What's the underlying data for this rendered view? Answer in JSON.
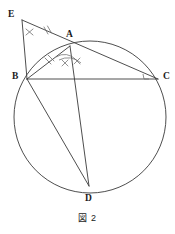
{
  "figure": {
    "caption": "図 2",
    "caption_position": {
      "y": 211
    },
    "stroke_color": "#3a3a3a",
    "mark_color": "#6f6f6f",
    "label_color": "#1a1a1a",
    "background": "#ffffff",
    "circle": {
      "name": "circumscribed-circle",
      "cx": 90,
      "cy": 117,
      "r": 76
    },
    "points": [
      {
        "id": "E",
        "label": "E",
        "x": 22,
        "y": 20,
        "label_x": 8,
        "label_y": 10
      },
      {
        "id": "A",
        "label": "A",
        "x": 70,
        "y": 46,
        "label_x": 66,
        "label_y": 30
      },
      {
        "id": "B",
        "label": "B",
        "x": 27,
        "y": 79,
        "label_x": 12,
        "label_y": 72
      },
      {
        "id": "C",
        "label": "C",
        "x": 158,
        "y": 79,
        "label_x": 163,
        "label_y": 72
      },
      {
        "id": "D",
        "label": "D",
        "x": 89,
        "y": 186,
        "label_x": 85,
        "label_y": 194
      }
    ],
    "segments": [
      {
        "name": "segment-EC",
        "from": "E",
        "to": "C",
        "x1": 22,
        "y1": 20,
        "x2": 158,
        "y2": 79
      },
      {
        "name": "segment-EB",
        "from": "E",
        "to": "B",
        "x1": 22,
        "y1": 20,
        "x2": 27,
        "y2": 79
      },
      {
        "name": "segment-BA",
        "from": "B",
        "to": "A",
        "x1": 27,
        "y1": 79,
        "x2": 70,
        "y2": 46
      },
      {
        "name": "segment-BC",
        "from": "B",
        "to": "C",
        "x1": 27,
        "y1": 79,
        "x2": 158,
        "y2": 79
      },
      {
        "name": "segment-BD",
        "from": "B",
        "to": "D",
        "x1": 27,
        "y1": 79,
        "x2": 89,
        "y2": 186
      },
      {
        "name": "segment-AD",
        "from": "A",
        "to": "D",
        "x1": 70,
        "y1": 46,
        "x2": 89,
        "y2": 186
      }
    ],
    "marks": {
      "angle-mark-E": {
        "type": "cross-tick",
        "note": "X mark at angle E"
      },
      "angle-arcs-A": {
        "type": "double-arc",
        "note": "two angle arcs at vertex A with cross ticks"
      },
      "tick-EA": {
        "type": "double-tick",
        "note": "congruence ticks on EA"
      },
      "tick-BA": {
        "type": "double-tick",
        "note": "congruence ticks on BA"
      },
      "right-angle-C": {
        "type": "right-angle-square",
        "note": "right angle at C between BC and CE"
      }
    }
  }
}
